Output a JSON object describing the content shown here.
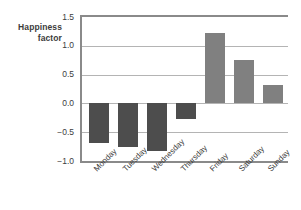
{
  "chart_data": {
    "type": "bar",
    "title": "",
    "xlabel": "",
    "ylabel": "Happiness factor",
    "ylabel_line1": "Happiness",
    "ylabel_line2": "factor",
    "categories": [
      "Monday",
      "Tuesday",
      "Wednesday",
      "Thursday",
      "Friday",
      "Saturday",
      "Sunday"
    ],
    "values": [
      -0.68,
      -0.76,
      -0.82,
      -0.28,
      1.23,
      0.76,
      0.32
    ],
    "ylim": [
      -1.0,
      1.5
    ],
    "yticks": [
      1.5,
      1.0,
      0.5,
      0.0,
      -0.5,
      -1.0
    ],
    "ytick_labels": [
      "1.5",
      "1.0",
      "0.5",
      "0.0",
      "−0.5",
      "−1.0"
    ],
    "grid": true,
    "grid_axis": "y",
    "legend": false,
    "legend_position": "none",
    "xtick_rotation": -45,
    "colors": {
      "negative_bar": "#4d4d4d",
      "positive_bar": "#808080",
      "gridline": "#b4b4b4",
      "axis": "#8a8a8a",
      "text": "#3c3c3c",
      "background": "#ffffff"
    }
  }
}
